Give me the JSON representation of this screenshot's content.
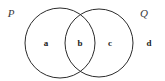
{
  "diagram": {
    "type": "venn-2-set",
    "title": "",
    "background_color": "#ffffff",
    "stroke_color": "#2b2b2b",
    "stroke_width": 1,
    "fill": "none",
    "canvas": {
      "width": 165,
      "height": 81
    }
  },
  "sets": [
    {
      "id": "P",
      "label": "P",
      "label_style": "italic-serif",
      "label_color": "#3a3a3a",
      "label_x": 11,
      "label_y": 13,
      "circle": {
        "cx": 60,
        "cy": 43,
        "r": 35
      }
    },
    {
      "id": "Q",
      "label": "Q",
      "label_style": "italic-serif",
      "label_color": "#3a3a3a",
      "label_x": 144,
      "label_y": 13,
      "circle": {
        "cx": 99,
        "cy": 43,
        "r": 34
      }
    }
  ],
  "regions": [
    {
      "id": "a",
      "label": "a",
      "description": "P only",
      "label_color": "#222222",
      "label_x": 46,
      "label_y": 43
    },
    {
      "id": "b",
      "label": "b",
      "description": "P intersect Q",
      "label_color": "#222222",
      "label_x": 80,
      "label_y": 43
    },
    {
      "id": "c",
      "label": "c",
      "description": "Q only",
      "label_color": "#222222",
      "label_x": 110,
      "label_y": 43
    },
    {
      "id": "d",
      "label": "d",
      "description": "outside P and Q",
      "label_color": "#222222",
      "label_x": 149,
      "label_y": 43
    }
  ]
}
